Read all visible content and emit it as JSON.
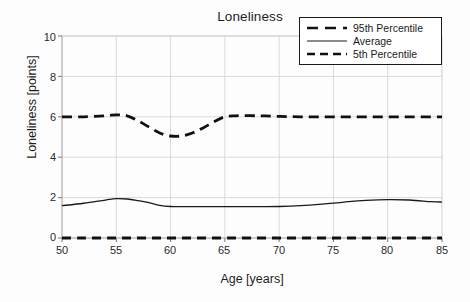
{
  "chart_data": {
    "type": "line",
    "title": "Loneliness",
    "xlabel": "Age [years]",
    "ylabel": "Loneliness [points]",
    "xlim": [
      50,
      85
    ],
    "ylim": [
      0,
      10
    ],
    "xticks": [
      50,
      55,
      60,
      65,
      70,
      75,
      80,
      85
    ],
    "yticks": [
      0,
      2,
      4,
      6,
      8,
      10
    ],
    "grid": true,
    "legend_position": "top-right",
    "x": [
      50,
      52,
      54,
      55,
      56,
      57,
      58,
      59,
      60,
      61,
      62,
      63,
      64,
      65,
      66,
      68,
      70,
      72,
      74,
      76,
      78,
      80,
      82,
      84,
      85
    ],
    "series": [
      {
        "name": "95th Percentile",
        "style": "dashed",
        "color": "#111111",
        "values": [
          6.0,
          6.0,
          6.05,
          6.1,
          6.05,
          5.8,
          5.5,
          5.2,
          5.05,
          5.05,
          5.2,
          5.45,
          5.75,
          6.0,
          6.05,
          6.05,
          6.02,
          6.0,
          6.0,
          6.0,
          6.0,
          6.0,
          6.0,
          6.0,
          6.0
        ]
      },
      {
        "name": "Average",
        "style": "solid",
        "color": "#1a1a1a",
        "values": [
          1.6,
          1.72,
          1.88,
          1.95,
          1.93,
          1.85,
          1.75,
          1.62,
          1.56,
          1.55,
          1.55,
          1.55,
          1.55,
          1.55,
          1.55,
          1.55,
          1.56,
          1.6,
          1.68,
          1.78,
          1.86,
          1.9,
          1.88,
          1.8,
          1.78
        ]
      },
      {
        "name": "5th Percentile",
        "style": "dashed",
        "color": "#111111",
        "values": [
          0.0,
          0.0,
          0.0,
          0.0,
          0.0,
          0.0,
          0.0,
          0.0,
          0.0,
          0.0,
          0.0,
          0.0,
          0.0,
          0.0,
          0.0,
          0.0,
          0.0,
          0.0,
          0.0,
          0.0,
          0.0,
          0.0,
          0.0,
          0.0,
          0.0
        ]
      }
    ]
  },
  "legend": {
    "items": [
      {
        "label": "95th Percentile",
        "sample": "thick-dashed-line"
      },
      {
        "label": "Average",
        "sample": "thin-solid-line"
      },
      {
        "label": "5th Percentile",
        "sample": "thick-dashed-line"
      }
    ]
  },
  "axes": {
    "y_tick_labels": [
      "10",
      "8",
      "6",
      "4",
      "2",
      "0"
    ],
    "x_tick_labels": [
      "50",
      "55",
      "60",
      "65",
      "70",
      "75",
      "80",
      "85"
    ]
  }
}
